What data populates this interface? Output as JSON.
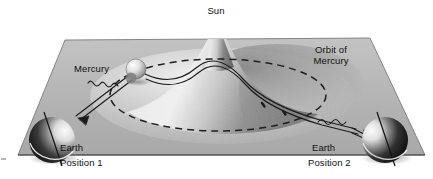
{
  "figure": {
    "background_color": "#ffffff",
    "plane_color": "#b4b4b4",
    "line_color": "#1a1a1a",
    "text_color": "#111111"
  },
  "labels": {
    "sun": "Sun",
    "mercury": "Mercury",
    "orbit_line_1": "Orbit of",
    "orbit_line_2": "Mercury",
    "earth_left": "Earth",
    "position_left": "Position 1",
    "earth_right": "Earth",
    "position_right": "Position 2"
  },
  "objects": {
    "sun_well": {
      "name": "sun-gravity-well",
      "peak_x": 218,
      "peak_y": 23
    },
    "mercury_sphere": {
      "name": "mercury-sphere",
      "cx": 136,
      "cy": 69,
      "r": 10
    },
    "earth_left_sphere": {
      "name": "earth-sphere-position-1",
      "cx": 52,
      "cy": 140,
      "r": 23
    },
    "earth_right_sphere": {
      "name": "earth-sphere-position-2",
      "cx": 385,
      "cy": 140,
      "r": 23
    },
    "orbit_ellipse": {
      "name": "mercury-orbit-dashed-ellipse",
      "cx": 218,
      "cy": 95,
      "rx": 108,
      "ry": 36
    },
    "spacetime_plane": {
      "name": "spacetime-plane",
      "corners": [
        [
          65,
          40
        ],
        [
          370,
          38
        ],
        [
          425,
          155
        ],
        [
          18,
          155
        ]
      ]
    }
  }
}
